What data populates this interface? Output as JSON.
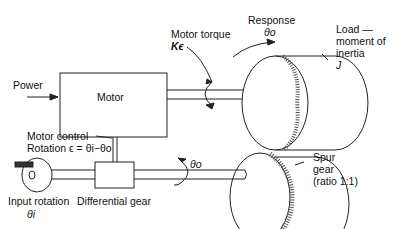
{
  "diagram": {
    "type": "servomechanism schematic",
    "labels": {
      "power": "Power",
      "motor": "Motor",
      "motor_torque": "Motor torque",
      "motor_torque_symbol": "Kϵ",
      "response": "Response",
      "response_symbol": "θo",
      "load_line1": "Load —",
      "load_line2": "moment of",
      "load_line3": "inertia",
      "load_symbol": "J",
      "motor_control_line1": "Motor control",
      "motor_control_line2": "Rotation ϵ = θi−θo",
      "theta_o_shaft": "θo",
      "spur_line1": "Spur",
      "spur_line2": "gear",
      "spur_line3": "(ratio 1:1)",
      "input_line1": "Input rotation",
      "input_symbol": "θi",
      "differential": "Differential gear"
    },
    "colors": {
      "line": "#222222",
      "background": "#ffffff"
    }
  }
}
